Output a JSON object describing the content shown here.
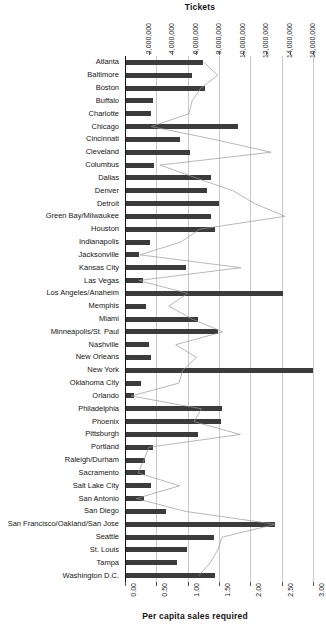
{
  "chart_data": {
    "type": "bar",
    "title": "",
    "orientation": "horizontal",
    "grid": true,
    "legend": false,
    "top_axis": {
      "label": "Tickets",
      "ticks": [
        "2,000,000",
        "4,000,000",
        "6,000,000",
        "8,000,000",
        "10,000,000",
        "12,000,000",
        "14,000,000",
        "16,000,000"
      ],
      "tick_values": [
        2000000,
        4000000,
        6000000,
        8000000,
        10000000,
        12000000,
        14000000,
        16000000
      ],
      "range": [
        0,
        16000000
      ]
    },
    "bottom_axis": {
      "label": "Per capita sales required",
      "ticks": [
        "0.00",
        "0.50",
        "1.00",
        "1.50",
        "2.00",
        "2.50",
        "3.00"
      ],
      "tick_values": [
        0.0,
        0.5,
        1.0,
        1.5,
        2.0,
        2.5,
        3.0
      ],
      "range": [
        0,
        3.0
      ]
    },
    "categories": [
      "Atlanta",
      "Baltimore",
      "Boston",
      "Buffalo",
      "Charlotte",
      "Chicago",
      "Cincinnati",
      "Cleveland",
      "Columbus",
      "Dallas",
      "Denver",
      "Detroit",
      "Green Bay/Milwaukee",
      "Houston",
      "Indianapolis",
      "Jacksonville",
      "Kansas City",
      "Las Vegas",
      "Los Angeles/Anaheim",
      "Memphis",
      "Miami",
      "Minneapolis/St. Paul",
      "Nashville",
      "New Orleans",
      "New York",
      "Oklahoma City",
      "Orlando",
      "Philadelphia",
      "Phoenix",
      "Pittsburgh",
      "Portland",
      "Raleigh/Durham",
      "Sacramento",
      "Salt Lake City",
      "San Antonio",
      "San Diego",
      "San Francisco/Oakland/San Jose",
      "Seattle",
      "St. Louis",
      "Tampa",
      "Washington D.C."
    ],
    "series": [
      {
        "name": "Tickets",
        "render": "bar",
        "axis": "top",
        "color": "#3b3b3b",
        "values": [
          6650000,
          5700000,
          6800000,
          2400000,
          2200000,
          9600000,
          4700000,
          5550000,
          2450000,
          7300000,
          7000000,
          8000000,
          7300000,
          7700000,
          2150000,
          1200000,
          5200000,
          1550000,
          13450000,
          1800000,
          6200000,
          7900000,
          2050000,
          2250000,
          16000000,
          1400000,
          750000,
          8250000,
          8200000,
          6250000,
          2350000,
          1700000,
          1700000,
          2250000,
          1650000,
          3500000,
          12800000,
          7600000,
          5300000,
          4450000,
          7700000
        ]
      },
      {
        "name": "Per capita sales required",
        "render": "line",
        "axis": "bottom",
        "color": "#9a9a9a",
        "values": [
          1.26,
          1.48,
          1.21,
          1.07,
          1.02,
          0.42,
          1.42,
          2.33,
          0.56,
          1.13,
          1.72,
          2.07,
          2.55,
          1.19,
          0.89,
          0.24,
          1.85,
          0.22,
          1.0,
          0.7,
          1.07,
          1.56,
          0.81,
          1.14,
          0.92,
          0.86,
          0.1,
          1.22,
          1.1,
          1.84,
          0.38,
          0.3,
          0.21,
          0.87,
          0.18,
          0.97,
          2.4,
          1.55,
          1.48,
          1.36,
          1.18
        ]
      }
    ]
  }
}
